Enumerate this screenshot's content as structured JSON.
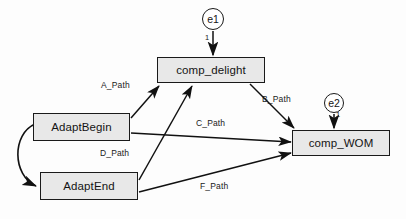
{
  "diagram": {
    "type": "sem-path-diagram",
    "background_color": "#fdfdfd",
    "node_fill_color": "#e8e8e8",
    "stroke_color": "#1a1a1a",
    "observed_variables": [
      {
        "id": "comp_delight",
        "label": "comp_delight",
        "x": 157,
        "y": 57,
        "w": 108,
        "h": 26
      },
      {
        "id": "comp_wom",
        "label": "comp_WOM",
        "x": 292,
        "y": 130,
        "w": 98,
        "h": 26
      },
      {
        "id": "adapt_begin",
        "label": "AdaptBegin",
        "x": 33,
        "y": 113,
        "w": 97,
        "h": 28
      },
      {
        "id": "adapt_end",
        "label": "AdaptEnd",
        "x": 40,
        "y": 172,
        "w": 98,
        "h": 28
      }
    ],
    "error_terms": [
      {
        "id": "e1",
        "label": "e1",
        "cx": 213,
        "cy": 19,
        "r": 11,
        "fixed_value": "1",
        "target": "comp_delight"
      },
      {
        "id": "e2",
        "label": "e2",
        "cx": 334,
        "cy": 103,
        "r": 10,
        "fixed_value": "1",
        "target": "comp_wom"
      }
    ],
    "paths": [
      {
        "id": "a_path",
        "label": "A_Path",
        "from": "adapt_begin",
        "to": "comp_delight",
        "label_x": 101,
        "label_y": 80
      },
      {
        "id": "b_path",
        "label": "B_Path",
        "from": "comp_delight",
        "to": "comp_wom",
        "label_x": 262,
        "label_y": 94
      },
      {
        "id": "c_path",
        "label": "C_Path",
        "from": "adapt_begin",
        "to": "comp_wom",
        "label_x": 196,
        "label_y": 118
      },
      {
        "id": "d_path",
        "label": "D_Path",
        "from": "adapt_end",
        "to": "comp_delight",
        "label_x": 100,
        "label_y": 148
      },
      {
        "id": "f_path",
        "label": "F_Path",
        "from": "adapt_end",
        "to": "comp_wom",
        "label_x": 200,
        "label_y": 181
      }
    ],
    "covariances": [
      {
        "id": "adapt_covariance",
        "between": [
          "adapt_begin",
          "adapt_end"
        ],
        "style": "double-headed-curved"
      }
    ]
  }
}
